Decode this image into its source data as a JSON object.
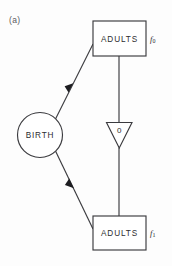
{
  "figure": {
    "panel_label": "(a)",
    "background_color": "#fdfdfd",
    "line_color": "#3b3b3f"
  },
  "nodes": {
    "source": {
      "label": "BIRTH",
      "shape": "circle"
    },
    "top_box": {
      "label": "ADULTS",
      "shape": "rectangle",
      "side_label": "f",
      "side_index": "0"
    },
    "bottom_box": {
      "label": "ADULTS",
      "shape": "rectangle",
      "side_label": "f",
      "side_index": "1"
    },
    "delay": {
      "label": "0",
      "shape": "down-triangle"
    }
  },
  "edges": {
    "birth_to_top": {
      "from": "BIRTH",
      "to": "ADULTS f0",
      "style": "arrow"
    },
    "birth_to_bottom": {
      "from": "BIRTH",
      "to": "ADULTS f1",
      "style": "arrow"
    },
    "top_to_delay": {
      "from": "ADULTS f0",
      "to": "0",
      "style": "line"
    },
    "delay_to_bottom": {
      "from": "0",
      "to": "ADULTS f1",
      "style": "line"
    }
  }
}
